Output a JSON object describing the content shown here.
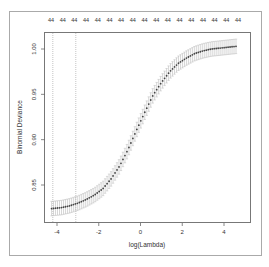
{
  "chart_data": {
    "type": "line",
    "title": "",
    "xlabel": "log(Lambda)",
    "ylabel": "Binomial Deviance",
    "xlim": [
      -4.5,
      5.0
    ],
    "ylim": [
      0.815,
      1.015
    ],
    "x_ticks": [
      -4,
      -2,
      0,
      2,
      4
    ],
    "x_tick_labels": [
      "-4",
      "-2",
      "0",
      "2",
      "4"
    ],
    "y_ticks": [
      0.85,
      0.9,
      0.95,
      1.0
    ],
    "y_tick_labels": [
      "0.85",
      "0.90",
      "0.95",
      "1.00"
    ],
    "top_axis_labels": [
      "44",
      "44",
      "44",
      "44",
      "44",
      "44",
      "44",
      "44",
      "44",
      "44",
      "44",
      "44",
      "44",
      "44",
      "44",
      "44",
      "44"
    ],
    "grid": false,
    "legend": null,
    "vertical_lines": [
      {
        "x": -4.2,
        "style": "dotted",
        "label": "lambda.min"
      },
      {
        "x": -3.1,
        "style": "dotted",
        "label": "lambda.1se"
      }
    ],
    "series": [
      {
        "name": "Binomial Deviance (CV mean)",
        "marker": "point",
        "error_bars": true,
        "x": [
          -4.26,
          -3.8,
          -3.4,
          -3.0,
          -2.6,
          -2.2,
          -1.8,
          -1.4,
          -1.0,
          -0.6,
          -0.2,
          0.2,
          0.6,
          1.0,
          1.4,
          1.8,
          2.2,
          2.6,
          3.0,
          3.4,
          3.8,
          4.2,
          4.6
        ],
        "values": [
          0.824,
          0.825,
          0.827,
          0.83,
          0.834,
          0.839,
          0.846,
          0.857,
          0.871,
          0.889,
          0.91,
          0.93,
          0.949,
          0.963,
          0.975,
          0.984,
          0.99,
          0.995,
          0.998,
          1.0,
          1.001,
          1.002,
          1.003
        ],
        "error": [
          0.008,
          0.008,
          0.008,
          0.008,
          0.008,
          0.008,
          0.008,
          0.008,
          0.008,
          0.008,
          0.008,
          0.008,
          0.008,
          0.008,
          0.008,
          0.008,
          0.008,
          0.008,
          0.008,
          0.008,
          0.008,
          0.008,
          0.008
        ]
      }
    ]
  },
  "colors": {
    "curve": "#444444",
    "error_bars": "#bbbbbb",
    "axis": "#555555",
    "frame": "#999999",
    "vline": "#aaaaaa"
  }
}
